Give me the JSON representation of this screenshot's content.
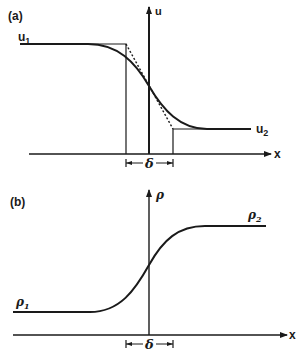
{
  "panel_a": {
    "label": "(a)",
    "y_axis_label": "u",
    "x_axis_label": "x",
    "upstream_label": "u",
    "upstream_sub": "1",
    "downstream_label": "u",
    "downstream_sub": "2",
    "width_label": "δ"
  },
  "panel_b": {
    "label": "(b)",
    "y_axis_label": "ρ",
    "x_axis_label": "x",
    "upstream_label": "ρ",
    "upstream_sub": "1",
    "downstream_label": "ρ",
    "downstream_sub": "2",
    "width_label": "δ"
  },
  "colors": {
    "ink": "#1a1a1a",
    "background": "#ffffff"
  }
}
